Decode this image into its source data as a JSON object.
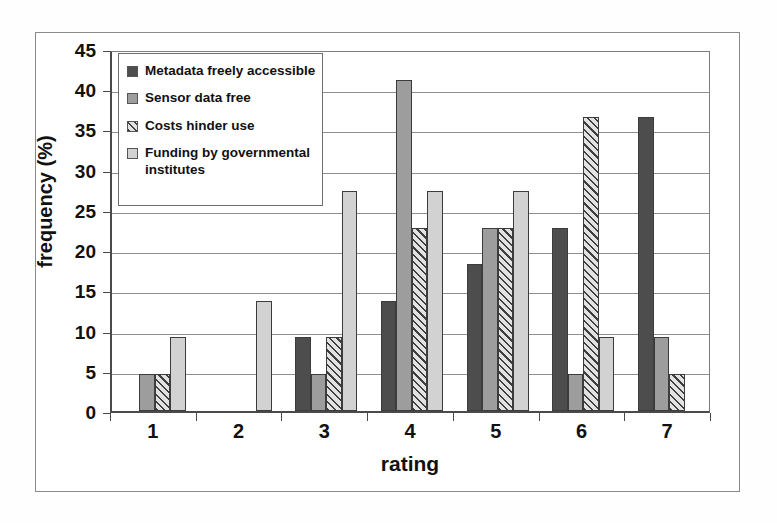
{
  "chart_data": {
    "type": "bar",
    "title": "",
    "xlabel": "rating",
    "ylabel": "frequency (%)",
    "categories": [
      "1",
      "2",
      "3",
      "4",
      "5",
      "6",
      "7"
    ],
    "ylim": [
      0,
      45
    ],
    "yticks": [
      0,
      5,
      10,
      15,
      20,
      25,
      30,
      35,
      40,
      45
    ],
    "grid": true,
    "legend_position": "top-left",
    "series": [
      {
        "name": "Metadata freely accessible",
        "color": "#4d4d4d",
        "pattern": "solid-dark",
        "values": [
          0,
          0,
          9.2,
          13.7,
          18.3,
          22.8,
          36.5
        ]
      },
      {
        "name": "Sensor data free",
        "color": "#9d9d9d",
        "pattern": "solid-medium",
        "values": [
          4.6,
          0,
          4.6,
          41.1,
          22.8,
          4.6,
          9.2
        ]
      },
      {
        "name": "Costs hinder use",
        "color": "#e2e2e2",
        "pattern": "diagonal-hatch",
        "values": [
          4.6,
          0,
          9.2,
          22.8,
          22.8,
          36.5,
          4.6
        ]
      },
      {
        "name": "Funding by governmental institutes",
        "color": "#d2d2d2",
        "pattern": "solid-light",
        "values": [
          9.2,
          13.7,
          27.3,
          27.3,
          27.3,
          9.2,
          0
        ]
      }
    ]
  },
  "legend": {
    "items": [
      {
        "label": "Metadata freely accessible"
      },
      {
        "label": "Sensor data free"
      },
      {
        "label": "Costs hinder use"
      },
      {
        "label": "Funding by governmental institutes"
      }
    ]
  }
}
